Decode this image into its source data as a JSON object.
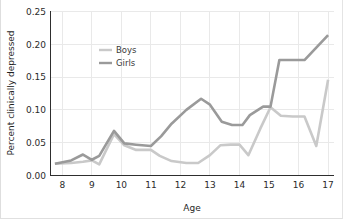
{
  "chart_data": {
    "type": "line",
    "title": "",
    "xlabel": "Age",
    "ylabel": "Percent clinically depressed",
    "xlim": [
      7.6,
      17.2
    ],
    "ylim": [
      0.0,
      0.25
    ],
    "grid": true,
    "legend_position": "upper-left-inside",
    "x_ticks": [
      "8",
      "9",
      "10",
      "11",
      "12",
      "13",
      "14",
      "15",
      "16",
      "17"
    ],
    "x_tick_values": [
      8,
      9,
      10,
      11,
      12,
      13,
      14,
      15,
      16,
      17
    ],
    "y_ticks": [
      "0.00",
      "0.05",
      "0.10",
      "0.15",
      "0.20",
      "0.25"
    ],
    "y_tick_values": [
      0.0,
      0.05,
      0.1,
      0.15,
      0.2,
      0.25
    ],
    "series": [
      {
        "name": "Boys",
        "color": "#c9c9c9",
        "x": [
          7.75,
          8.3,
          8.7,
          9.0,
          9.25,
          9.75,
          10.1,
          10.5,
          11.0,
          11.3,
          11.7,
          12.2,
          12.6,
          13.0,
          13.35,
          13.7,
          14.0,
          14.3,
          14.7,
          15.05,
          15.4,
          15.8,
          16.2,
          16.6,
          17.0
        ],
        "y": [
          0.018,
          0.019,
          0.021,
          0.023,
          0.017,
          0.063,
          0.046,
          0.039,
          0.039,
          0.03,
          0.022,
          0.019,
          0.019,
          0.031,
          0.046,
          0.047,
          0.047,
          0.031,
          0.071,
          0.104,
          0.091,
          0.09,
          0.09,
          0.045,
          0.146
        ]
      },
      {
        "name": "Girls",
        "color": "#9a9a9a",
        "x": [
          7.75,
          8.3,
          8.7,
          9.0,
          9.25,
          9.75,
          10.1,
          10.5,
          11.0,
          11.35,
          11.7,
          12.2,
          12.7,
          13.0,
          13.4,
          13.75,
          14.1,
          14.35,
          14.8,
          15.05,
          15.35,
          15.8,
          16.2,
          16.6,
          17.0
        ],
        "y": [
          0.018,
          0.023,
          0.032,
          0.024,
          0.03,
          0.068,
          0.049,
          0.047,
          0.045,
          0.06,
          0.079,
          0.1,
          0.117,
          0.108,
          0.082,
          0.077,
          0.077,
          0.092,
          0.105,
          0.105,
          0.176,
          0.176,
          0.176,
          0.195,
          0.214
        ]
      }
    ]
  },
  "legend": {
    "entries": [
      {
        "label": "Boys"
      },
      {
        "label": "Girls"
      }
    ]
  }
}
